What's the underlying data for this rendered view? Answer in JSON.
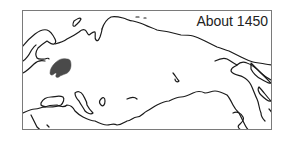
{
  "map": {
    "title": "About 1450",
    "colors": {
      "coastline": "#1a1a1a",
      "shaded_territory": "#4a4a4a",
      "frame": "#7a7a7a",
      "background": "#ffffff"
    },
    "regions": [
      {
        "name": "shaded-territory",
        "description": "dark shaded region in western Russia"
      }
    ]
  }
}
